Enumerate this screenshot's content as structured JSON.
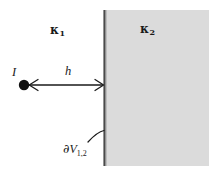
{
  "figure": {
    "name": "point-current-source-near-planar-interface",
    "width": 209,
    "height": 171,
    "background_color": "#ffffff"
  },
  "regions": {
    "left": {
      "label": "κ",
      "subscript": "1",
      "fill_color": "#ffffff",
      "description": "white region left of interface"
    },
    "right": {
      "label": "κ",
      "subscript": "2",
      "fill_color": "#dedede",
      "description": "shaded region right of interface"
    }
  },
  "interface": {
    "line_color": "#4a4a4a",
    "x": 104.5,
    "y_top": 10,
    "y_bottom": 166,
    "label_partial": "∂",
    "label_v": "V",
    "label_subscript": "1,2",
    "full_label": "∂V1,2"
  },
  "source": {
    "label": "I",
    "dot_color": "#111111",
    "center_x": 24,
    "center_y": 85,
    "radius": 5.2
  },
  "dimension": {
    "label": "h",
    "arrow_color": "#1a1a1a",
    "x_start": 27,
    "x_end": 104,
    "y": 85,
    "double_headed": true
  },
  "leader": {
    "name": "interface-leader-curve",
    "color": "#1a1a1a",
    "from_x": 88,
    "from_y": 143,
    "to_x": 104,
    "to_y": 132
  }
}
